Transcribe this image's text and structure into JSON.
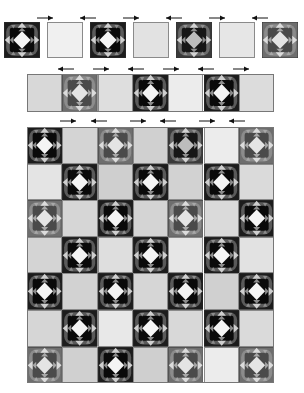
{
  "colors": {
    "background": "#ffffff",
    "dark_block_bg": "#1a1a1a",
    "mid_block_bg": "#6e6e6e",
    "ring_dark": "#0e0e0e",
    "diamond_light": "#f2f2f2",
    "point_light": "#c8c8c8",
    "border": "#8a8a8a"
  },
  "top_row": {
    "y": 22,
    "size": 36,
    "cells": [
      {
        "x": 4,
        "type": "block",
        "tone": "dark"
      },
      {
        "x": 47,
        "type": "plain",
        "fill": "#f0f0f0"
      },
      {
        "x": 90,
        "type": "block",
        "tone": "dark"
      },
      {
        "x": 133,
        "type": "plain",
        "fill": "#e2e2e2"
      },
      {
        "x": 176,
        "type": "block",
        "tone": "darkmid"
      },
      {
        "x": 219,
        "type": "plain",
        "fill": "#e6e6e6"
      },
      {
        "x": 262,
        "type": "block",
        "tone": "mid"
      }
    ],
    "arrows": [
      {
        "x": 37,
        "y": 15,
        "dir": "right"
      },
      {
        "x": 80,
        "y": 15,
        "dir": "left"
      },
      {
        "x": 123,
        "y": 15,
        "dir": "right"
      },
      {
        "x": 166,
        "y": 15,
        "dir": "left"
      },
      {
        "x": 209,
        "y": 15,
        "dir": "right"
      },
      {
        "x": 252,
        "y": 15,
        "dir": "left"
      }
    ]
  },
  "middle_strip": {
    "x": 27,
    "y": 74,
    "cell_w": 35.3,
    "h": 38,
    "cells": [
      {
        "type": "plain",
        "fill": "#d8d8d8"
      },
      {
        "type": "block",
        "tone": "mid"
      },
      {
        "type": "plain",
        "fill": "#dedede"
      },
      {
        "type": "block",
        "tone": "dark"
      },
      {
        "type": "plain",
        "fill": "#ececec"
      },
      {
        "type": "block",
        "tone": "dark"
      },
      {
        "type": "plain",
        "fill": "#dcdcdc"
      }
    ],
    "arrows": [
      {
        "x": 58,
        "y": 66,
        "dir": "left"
      },
      {
        "x": 93,
        "y": 66,
        "dir": "right"
      },
      {
        "x": 128,
        "y": 66,
        "dir": "left"
      },
      {
        "x": 163,
        "y": 66,
        "dir": "right"
      },
      {
        "x": 198,
        "y": 66,
        "dir": "left"
      },
      {
        "x": 233,
        "y": 66,
        "dir": "right"
      }
    ]
  },
  "quilt_grid": {
    "x": 27,
    "y": 127,
    "cell_w": 35.3,
    "cell_h": 36.6,
    "rows": 7,
    "cols": 7,
    "arrows": [
      {
        "x": 60,
        "y": 118,
        "dir": "right"
      },
      {
        "x": 91,
        "y": 118,
        "dir": "left"
      },
      {
        "x": 130,
        "y": 118,
        "dir": "right"
      },
      {
        "x": 160,
        "y": 118,
        "dir": "left"
      },
      {
        "x": 199,
        "y": 118,
        "dir": "right"
      },
      {
        "x": 229,
        "y": 118,
        "dir": "left"
      }
    ],
    "cells": [
      [
        {
          "type": "block",
          "tone": "dark"
        },
        {
          "type": "plain",
          "fill": "#d4d4d4"
        },
        {
          "type": "block",
          "tone": "mid"
        },
        {
          "type": "plain",
          "fill": "#d0d0d0"
        },
        {
          "type": "block",
          "tone": "darkmid"
        },
        {
          "type": "plain",
          "fill": "#ececec"
        },
        {
          "type": "block",
          "tone": "mid"
        }
      ],
      [
        {
          "type": "plain",
          "fill": "#e4e4e4"
        },
        {
          "type": "block",
          "tone": "dark"
        },
        {
          "type": "plain",
          "fill": "#cfcfcf"
        },
        {
          "type": "block",
          "tone": "dark"
        },
        {
          "type": "plain",
          "fill": "#d2d2d2"
        },
        {
          "type": "block",
          "tone": "dark"
        },
        {
          "type": "plain",
          "fill": "#dadada"
        }
      ],
      [
        {
          "type": "block",
          "tone": "mid"
        },
        {
          "type": "plain",
          "fill": "#d6d6d6"
        },
        {
          "type": "block",
          "tone": "dark"
        },
        {
          "type": "plain",
          "fill": "#d4d4d4"
        },
        {
          "type": "block",
          "tone": "mid"
        },
        {
          "type": "plain",
          "fill": "#dadada"
        },
        {
          "type": "block",
          "tone": "dark"
        }
      ],
      [
        {
          "type": "plain",
          "fill": "#d4d4d4"
        },
        {
          "type": "block",
          "tone": "dark"
        },
        {
          "type": "plain",
          "fill": "#dedede"
        },
        {
          "type": "block",
          "tone": "dark"
        },
        {
          "type": "plain",
          "fill": "#e6e6e6"
        },
        {
          "type": "block",
          "tone": "dark"
        },
        {
          "type": "plain",
          "fill": "#e2e2e2"
        }
      ],
      [
        {
          "type": "block",
          "tone": "dark"
        },
        {
          "type": "plain",
          "fill": "#d2d2d2"
        },
        {
          "type": "block",
          "tone": "dark"
        },
        {
          "type": "plain",
          "fill": "#d6d6d6"
        },
        {
          "type": "block",
          "tone": "dark"
        },
        {
          "type": "plain",
          "fill": "#d0d0d0"
        },
        {
          "type": "block",
          "tone": "dark"
        }
      ],
      [
        {
          "type": "plain",
          "fill": "#d6d6d6"
        },
        {
          "type": "block",
          "tone": "dark"
        },
        {
          "type": "plain",
          "fill": "#e8e8e8"
        },
        {
          "type": "block",
          "tone": "dark"
        },
        {
          "type": "plain",
          "fill": "#d8d8d8"
        },
        {
          "type": "block",
          "tone": "dark"
        },
        {
          "type": "plain",
          "fill": "#dadada"
        }
      ],
      [
        {
          "type": "block",
          "tone": "mid"
        },
        {
          "type": "plain",
          "fill": "#d0d0d0"
        },
        {
          "type": "block",
          "tone": "dark"
        },
        {
          "type": "plain",
          "fill": "#cfcfcf"
        },
        {
          "type": "block",
          "tone": "mid"
        },
        {
          "type": "plain",
          "fill": "#ececec"
        },
        {
          "type": "block",
          "tone": "mid"
        }
      ]
    ]
  }
}
